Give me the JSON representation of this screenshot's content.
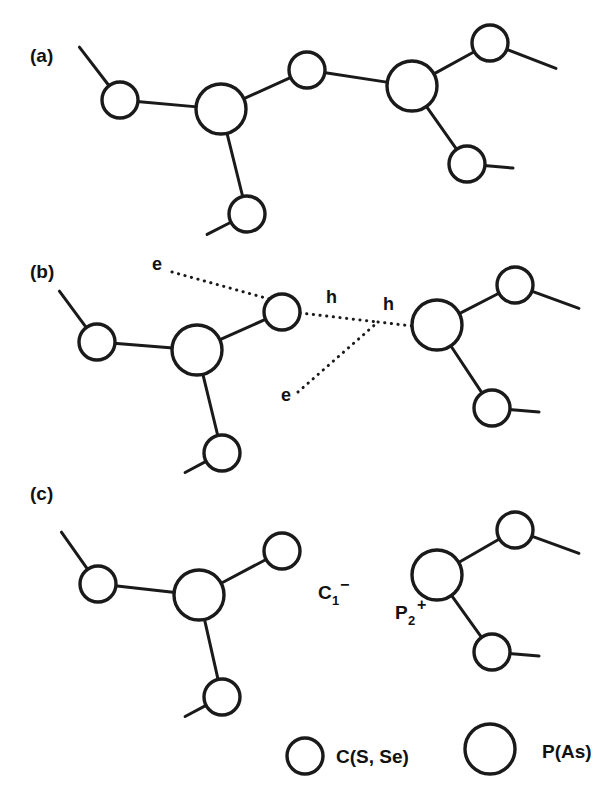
{
  "figure": {
    "background_color": "#ffffff",
    "stroke_color": "#1a1a1a",
    "atom_fill_color": "#ffffff",
    "width": 616,
    "height": 801
  },
  "panels": [
    {
      "id": "a",
      "label": "(a)",
      "label_x": 30,
      "label_y": 62,
      "description": "neutral defect-free chain segment",
      "atoms": [
        {
          "name": "a-c-left",
          "kind": "C",
          "cx": 120,
          "cy": 100,
          "r": 18
        },
        {
          "name": "a-p-left",
          "kind": "P",
          "cx": 221,
          "cy": 109,
          "r": 25
        },
        {
          "name": "a-c-bridge",
          "kind": "C",
          "cx": 307,
          "cy": 70,
          "r": 18
        },
        {
          "name": "a-p-right",
          "kind": "P",
          "cx": 412,
          "cy": 86,
          "r": 25
        },
        {
          "name": "a-c-topright",
          "kind": "C",
          "cx": 490,
          "cy": 43,
          "r": 18
        },
        {
          "name": "a-c-bottomleft",
          "kind": "C",
          "cx": 247,
          "cy": 214,
          "r": 18
        },
        {
          "name": "a-c-bottomright",
          "kind": "C",
          "cx": 467,
          "cy": 164,
          "r": 18
        }
      ],
      "bonds": [
        {
          "name": "a-bond-cleft-pleft",
          "from": "a-c-left",
          "to": "a-p-left"
        },
        {
          "name": "a-bond-pleft-bridge",
          "from": "a-p-left",
          "to": "a-c-bridge"
        },
        {
          "name": "a-bond-bridge-pright",
          "from": "a-c-bridge",
          "to": "a-p-right"
        },
        {
          "name": "a-bond-pright-topright",
          "from": "a-p-right",
          "to": "a-c-topright"
        },
        {
          "name": "a-bond-pleft-bottomleft",
          "from": "a-p-left",
          "to": "a-c-bottomleft"
        },
        {
          "name": "a-bond-pright-bottomrt",
          "from": "a-p-right",
          "to": "a-c-bottomright"
        }
      ],
      "stubs": [
        {
          "name": "a-stub-upper-left",
          "from": "a-c-left",
          "x2": 80,
          "y2": 48
        },
        {
          "name": "a-stub-top-right",
          "from": "a-c-topright",
          "x2": 555,
          "y2": 68
        },
        {
          "name": "a-stub-lower-left",
          "from": "a-c-bottomleft",
          "x2": 208,
          "y2": 234
        },
        {
          "name": "a-stub-lower-right",
          "from": "a-c-bottomright",
          "x2": 512,
          "y2": 168
        }
      ]
    },
    {
      "id": "b",
      "label": "(b)",
      "label_x": 30,
      "label_y": 278,
      "description": "electron and hole carriers on broken bond",
      "atoms": [
        {
          "name": "b-c-left",
          "kind": "C",
          "cx": 97,
          "cy": 342,
          "r": 18
        },
        {
          "name": "b-p-left",
          "kind": "P",
          "cx": 197,
          "cy": 350,
          "r": 25
        },
        {
          "name": "b-c-mid",
          "kind": "C",
          "cx": 282,
          "cy": 312,
          "r": 18
        },
        {
          "name": "b-p-right",
          "kind": "P",
          "cx": 437,
          "cy": 325,
          "r": 25
        },
        {
          "name": "b-c-topright",
          "kind": "C",
          "cx": 515,
          "cy": 285,
          "r": 18
        },
        {
          "name": "b-c-bottomleft",
          "kind": "C",
          "cx": 222,
          "cy": 453,
          "r": 18
        },
        {
          "name": "b-c-bottomright",
          "kind": "C",
          "cx": 492,
          "cy": 408,
          "r": 18
        }
      ],
      "bonds": [
        {
          "name": "b-bond-cleft-pleft",
          "from": "b-c-left",
          "to": "b-p-left"
        },
        {
          "name": "b-bond-pleft-mid",
          "from": "b-p-left",
          "to": "b-c-mid"
        },
        {
          "name": "b-bond-pright-topright",
          "from": "b-p-right",
          "to": "b-c-topright"
        },
        {
          "name": "b-bond-pleft-bottomleft",
          "from": "b-p-left",
          "to": "b-c-bottomleft"
        },
        {
          "name": "b-bond-pright-bottomrt",
          "from": "b-p-right",
          "to": "b-c-bottomright"
        }
      ],
      "stubs": [
        {
          "name": "b-stub-upper-left",
          "from": "b-c-left",
          "x2": 60,
          "y2": 292
        },
        {
          "name": "b-stub-top-right",
          "from": "b-c-topright",
          "x2": 578,
          "y2": 308
        },
        {
          "name": "b-stub-lower-left",
          "from": "b-c-bottomleft",
          "x2": 186,
          "y2": 472
        },
        {
          "name": "b-stub-lower-right",
          "from": "b-c-bottomright",
          "x2": 538,
          "y2": 412
        }
      ],
      "carriers": {
        "vertex_x": 378,
        "vertex_y": 322,
        "electron_top": {
          "label": "e",
          "label_x": 152,
          "label_y": 270,
          "line_from_x": 172,
          "line_from_y": 272,
          "line_to_x": 298,
          "line_to_y": 307
        },
        "electron_bottom": {
          "label": "e",
          "label_x": 281,
          "label_y": 401,
          "line_from_x": 298,
          "line_from_y": 392,
          "line_to_x": 378,
          "line_to_y": 322
        },
        "hole_left": {
          "label": "h",
          "label_x": 326,
          "label_y": 303,
          "line_from_x": 300,
          "line_from_y": 313,
          "line_to_x": 378,
          "line_to_y": 322
        },
        "hole_right": {
          "label": "h",
          "label_x": 383,
          "label_y": 310,
          "line_from_x": 378,
          "line_from_y": 322,
          "line_to_x": 412,
          "line_to_y": 326
        }
      }
    },
    {
      "id": "c",
      "label": "(c)",
      "label_x": 30,
      "label_y": 500,
      "description": "separated charged defect pair C1-minus and P2-plus",
      "atoms": [
        {
          "name": "c-left-c-left",
          "kind": "C",
          "cx": 98,
          "cy": 584,
          "r": 18
        },
        {
          "name": "c-left-p",
          "kind": "P",
          "cx": 199,
          "cy": 595,
          "r": 25
        },
        {
          "name": "c-left-c-topright",
          "kind": "C",
          "cx": 282,
          "cy": 551,
          "r": 18
        },
        {
          "name": "c-left-c-bottom",
          "kind": "C",
          "cx": 222,
          "cy": 697,
          "r": 18
        },
        {
          "name": "c-right-p",
          "kind": "P",
          "cx": 437,
          "cy": 575,
          "r": 25
        },
        {
          "name": "c-right-c-top",
          "kind": "C",
          "cx": 515,
          "cy": 530,
          "r": 18
        },
        {
          "name": "c-right-c-bottom",
          "kind": "C",
          "cx": 492,
          "cy": 652,
          "r": 18
        }
      ],
      "bonds": [
        {
          "name": "c-bond-left-cleft-p",
          "from": "c-left-c-left",
          "to": "c-left-p"
        },
        {
          "name": "c-bond-left-p-topright",
          "from": "c-left-p",
          "to": "c-left-c-topright"
        },
        {
          "name": "c-bond-left-p-bottom",
          "from": "c-left-p",
          "to": "c-left-c-bottom"
        },
        {
          "name": "c-bond-right-p-top",
          "from": "c-right-p",
          "to": "c-right-c-top"
        },
        {
          "name": "c-bond-right-p-bottom",
          "from": "c-right-p",
          "to": "c-right-c-bottom"
        }
      ],
      "stubs": [
        {
          "name": "c-stub-left-upper",
          "from": "c-left-c-left",
          "x2": 62,
          "y2": 533
        },
        {
          "name": "c-stub-left-lower",
          "from": "c-left-c-bottom",
          "x2": 186,
          "y2": 716
        },
        {
          "name": "c-stub-right-top",
          "from": "c-right-c-top",
          "x2": 578,
          "y2": 553
        },
        {
          "name": "c-stub-right-bottom",
          "from": "c-right-c-bottom",
          "x2": 538,
          "y2": 656
        }
      ],
      "species": [
        {
          "name": "species-c1-minus",
          "base": "C",
          "subscript": "1",
          "superscript": "−",
          "x": 318,
          "y": 599
        },
        {
          "name": "species-p2-plus",
          "base": "P",
          "subscript": "2",
          "superscript": "+",
          "x": 395,
          "y": 619
        }
      ]
    }
  ],
  "legend": {
    "entries": [
      {
        "name": "legend-entry-c",
        "symbol_kind": "C",
        "cx": 305,
        "cy": 756,
        "r": 18,
        "label": "C(S, Se)",
        "label_x": 336,
        "label_y": 763
      },
      {
        "name": "legend-entry-p",
        "symbol_kind": "P",
        "cx": 490,
        "cy": 749,
        "r": 25,
        "label": "P(As)",
        "label_x": 542,
        "label_y": 758
      }
    ]
  },
  "styles": {
    "bond_stroke_width": 3,
    "atom_stroke_width": 3.4,
    "carrier_stroke_width": 3,
    "carrier_dash": "0.2 6.5"
  }
}
